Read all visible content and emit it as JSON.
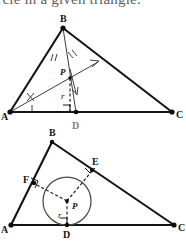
{
  "heading": {
    "text": "circle in a given triangle."
  },
  "figures": [
    {
      "id": "angle-bisector-construction",
      "caption_present": false,
      "vertex_labels": {
        "a": "A",
        "b": "B",
        "c": "C",
        "d": "D"
      },
      "point_labels": {
        "p": "P",
        "r": "r"
      },
      "geometry": {
        "A": [
          10,
          101
        ],
        "B": [
          63,
          17
        ],
        "C": [
          172,
          101
        ],
        "D": [
          76,
          101
        ],
        "P": [
          70,
          67
        ],
        "ray_end": [
          98,
          51
        ],
        "tick_marks_at_A": 1,
        "tick_marks_at_B": 2,
        "right_angle_at": "D"
      },
      "colors": {
        "stroke": "#141414",
        "thin_stroke": "#3d3d3d",
        "dash_stroke": "#222222"
      }
    },
    {
      "id": "inscribed-circle-result",
      "caption_present": false,
      "vertex_labels": {
        "a": "A",
        "b": "B",
        "c": "C",
        "d": "D",
        "e": "E",
        "f": "F"
      },
      "point_labels": {
        "p": "P",
        "r": "r"
      },
      "geometry": {
        "A": [
          11,
          104
        ],
        "B": [
          52,
          21
        ],
        "C": [
          174,
          104
        ],
        "D": [
          65,
          104
        ],
        "E": [
          93,
          48
        ],
        "F": [
          33,
          62
        ],
        "P": [
          67,
          80
        ],
        "radius": 24,
        "right_angle_at": [
          "D",
          "E",
          "F"
        ]
      },
      "colors": {
        "stroke": "#141414",
        "circle_stroke": "#4a4a4a",
        "dash_stroke": "#222222"
      }
    }
  ],
  "ghost_label": {
    "text": "D"
  }
}
